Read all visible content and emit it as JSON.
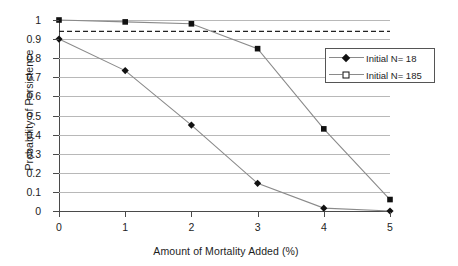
{
  "chart_data": {
    "type": "line",
    "title": "",
    "xlabel": "Amount of Mortality Added (%)",
    "ylabel": "Probability of Persistence",
    "x": [
      0,
      1,
      2,
      3,
      4,
      5
    ],
    "xlim": [
      0,
      5
    ],
    "ylim": [
      0,
      1
    ],
    "xticks": [
      "0",
      "1",
      "2",
      "3",
      "4",
      "5"
    ],
    "yticks": [
      "1",
      "0.9",
      "0.8",
      "0.7",
      "0.6",
      "0.5",
      "0.4",
      "0.3",
      "0.2",
      "0.1",
      "0"
    ],
    "ytick_values": [
      1,
      0.9,
      0.8,
      0.7,
      0.6,
      0.5,
      0.4,
      0.3,
      0.2,
      0.1,
      0
    ],
    "grid": "horizontal",
    "legend_position": "upper-right-inside",
    "series": [
      {
        "name": "Initial N= 18",
        "marker": "filled-diamond",
        "line_style": "solid",
        "values": [
          0.9,
          0.735,
          0.45,
          0.145,
          0.015,
          0.0
        ]
      },
      {
        "name": "Initial N= 185",
        "marker": "open-square",
        "line_style": "solid",
        "values": [
          1.0,
          0.99,
          0.98,
          0.85,
          0.43,
          0.06
        ]
      }
    ],
    "annotations": [
      {
        "name": "threshold-line",
        "type": "horizontal-dashed-line",
        "value": 0.94,
        "label": ""
      }
    ],
    "colors": {
      "line": "#8a8a8a",
      "marker": "#111111",
      "grid": "#b8b8b8",
      "axis": "#4a4a4a",
      "text": "#1d1d1d",
      "background": "#ffffff"
    }
  },
  "legend": {
    "items": [
      {
        "label": "Initial N= 18"
      },
      {
        "label": "Initial N= 185"
      }
    ]
  }
}
